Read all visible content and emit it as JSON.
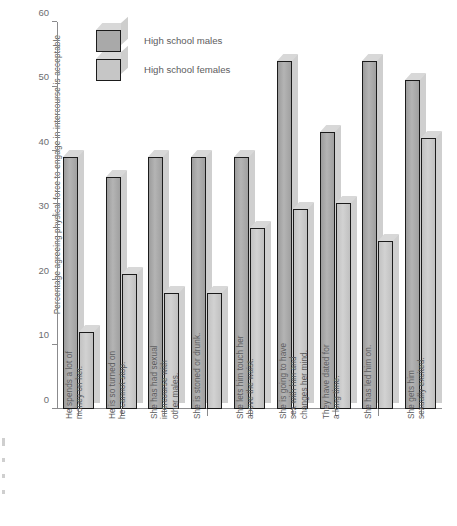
{
  "chart_data": {
    "type": "bar",
    "title": "",
    "xlabel": "",
    "ylabel": "Percentage agreeing physical force to engage in intercourse is acceptable",
    "ylim": [
      0,
      60
    ],
    "yticks": [
      0,
      10,
      20,
      30,
      40,
      50,
      60
    ],
    "grid": false,
    "legend_position": "top-left",
    "categories": [
      "He spends a lot of\nmoney on her.",
      "He is so turned on\nhe cannot stop.",
      "She has had sexual\nintercourse with\nother males.",
      "She is stoned or drunk.",
      "She lets him touch her\nabove the waist.",
      "She is going to have\nsex with him and\nchanges her mind.",
      "They have dated for\na long time.",
      "She has led him on.",
      "She gets him\nsexually excited."
    ],
    "series": [
      {
        "name": "High school males",
        "color": "#a9a9a9",
        "values": [
          39,
          36,
          39,
          39,
          39,
          54,
          43,
          54,
          51
        ]
      },
      {
        "name": "High school females",
        "color": "#c6c6c6",
        "values": [
          12,
          21,
          18,
          18,
          28,
          31,
          32,
          26,
          42
        ]
      }
    ]
  }
}
